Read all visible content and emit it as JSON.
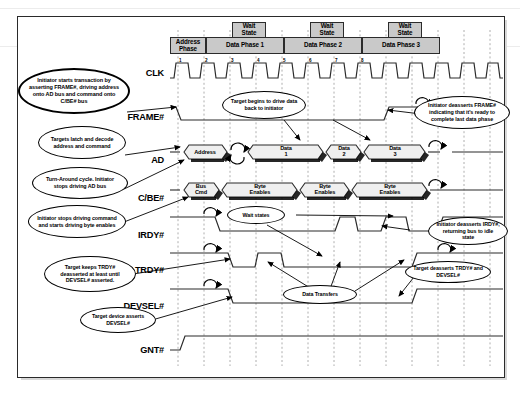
{
  "diagram": {
    "type": "timing-diagram"
  },
  "phases": {
    "address_phase": "Address\nPhase",
    "address_phase_line1": "Address",
    "address_phase_line2": "Phase",
    "data_phases": [
      "Data Phase 1",
      "Data Phase 2",
      "Data Phase 3"
    ],
    "wait_state_line1": "Wait",
    "wait_state_line2": "State",
    "wait_states": [
      "Wait State",
      "Wait State",
      "Wait State"
    ]
  },
  "signals": [
    {
      "name": "CLK",
      "label": "CLK"
    },
    {
      "name": "FRAME#",
      "label": "FRAME#"
    },
    {
      "name": "AD",
      "label": "AD"
    },
    {
      "name": "C/BE#",
      "label": "C/BE#"
    },
    {
      "name": "IRDY#",
      "label": "IRDY#"
    },
    {
      "name": "TRDY#",
      "label": "TRDY#"
    },
    {
      "name": "DEVSEL#",
      "label": "DEVSEL#"
    },
    {
      "name": "GNT#",
      "label": "GNT#"
    }
  ],
  "clock_cycles": [
    "1",
    "2",
    "3",
    "4",
    "5",
    "6",
    "7",
    "8"
  ],
  "ad_bus_values": [
    {
      "id": "address",
      "line1": "Address",
      "line2": ""
    },
    {
      "id": "data1",
      "line1": "Data",
      "line2": "1"
    },
    {
      "id": "data2",
      "line1": "Data",
      "line2": "2"
    },
    {
      "id": "data3",
      "line1": "Data",
      "line2": "3"
    }
  ],
  "cbe_bus_values": [
    {
      "id": "bus-cmd",
      "line1": "Bus",
      "line2": "Cmd"
    },
    {
      "id": "byte-enables-1",
      "line1": "Byte",
      "line2": "Enables"
    },
    {
      "id": "byte-enables-2",
      "line1": "Byte",
      "line2": "Enables"
    },
    {
      "id": "byte-enables-3",
      "line1": "Byte",
      "line2": "Enables"
    }
  ],
  "callouts": [
    {
      "id": "initiator-starts-transaction",
      "text": "Initiator starts transaction by asserting FRAME#, driving address onto AD bus and command onto C/BE# bus"
    },
    {
      "id": "targets-latch-decode",
      "text": "Targets latch and decode address and command"
    },
    {
      "id": "turn-around-cycle",
      "text": "Turn-Around cycle. Initiator stops driving AD bus"
    },
    {
      "id": "initiator-stops-driving-command",
      "text": "Initiator stops driving command and starts driving byte enables"
    },
    {
      "id": "target-keeps-trdy-deasserted",
      "text": "Target keeps TRDY# deasserted at least until DEVSEL# asserted."
    },
    {
      "id": "target-device-asserts-devsel",
      "text": "Target device asserts DEVSEL#"
    },
    {
      "id": "target-begins-drive-data",
      "text": "Target begins to drive data back to initiator"
    },
    {
      "id": "wait-states",
      "text": "Wait states"
    },
    {
      "id": "data-transfers",
      "text": "Data Transfers"
    },
    {
      "id": "initiator-deasserts-frame",
      "text": "Initiator deasserts FRAME# indicating that it's ready to complete last data phase"
    },
    {
      "id": "initiator-deasserts-irdy",
      "text": "Initiator deasserts IRDY#, returning bus to idle state"
    },
    {
      "id": "target-deasserts-trdy-devsel",
      "text": "Target deasserts TRDY# and DEVSEL#"
    }
  ],
  "colors": {
    "header_fill": "#c9c9c9",
    "line": "#2b2b2b",
    "grid": "#b4b4b4",
    "background": "#ffffff",
    "border": "#2a2a2a"
  }
}
